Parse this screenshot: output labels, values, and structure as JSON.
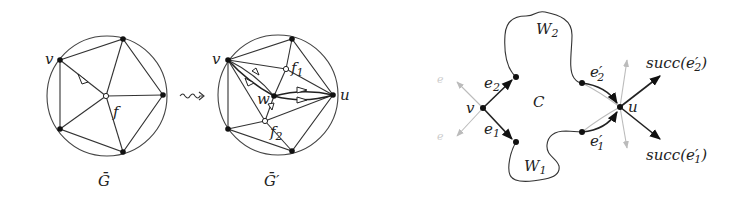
{
  "figure": {
    "left_panel": {
      "graph_G": {
        "caption": "Ḡ",
        "vertex_label_v": "v",
        "face_label_f": "f"
      },
      "transform_symbol": "⇝",
      "graph_G_prime": {
        "caption": "Ḡ′",
        "vertex_label_v": "v",
        "vertex_label_u": "u",
        "vertex_label_w": "w",
        "face_label_f1": "f",
        "face_label_f1_sub": "1",
        "face_label_f2": "f",
        "face_label_f2_sub": "2"
      }
    },
    "right_panel": {
      "vertex_v": "v",
      "vertex_u": "u",
      "cycle_label": "C",
      "walk_W2": "W",
      "walk_W2_sub": "2",
      "walk_W1": "W",
      "walk_W1_sub": "1",
      "edge_e2": "e",
      "edge_e2_sub": "2",
      "edge_e1": "e",
      "edge_e1_sub": "1",
      "edge_e2_prime": "e′",
      "edge_e2_prime_sub": "2",
      "edge_e1_prime": "e′",
      "edge_e1_prime_sub": "1",
      "succ_e2_prime_prefix": "succ(",
      "succ_e2_prime_var": "e′",
      "succ_e2_prime_sub": "2",
      "succ_e2_prime_suffix": ")",
      "succ_e1_prime_prefix": "succ(",
      "succ_e1_prime_var": "e′",
      "succ_e1_prime_sub": "1",
      "succ_e1_prime_suffix": ")",
      "faint_label_top": "e",
      "faint_label_bottom": "e"
    },
    "colors": {
      "ink": "#222222",
      "faint": "#bbbbbb",
      "background": "#ffffff"
    }
  }
}
